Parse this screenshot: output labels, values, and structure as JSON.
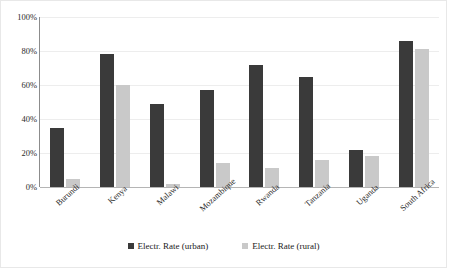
{
  "chart_data": {
    "type": "bar",
    "title": "",
    "xlabel": "",
    "ylabel": "",
    "ylim": [
      0,
      100
    ],
    "yunit": "%",
    "grid": true,
    "legend_position": "bottom",
    "categories": [
      "Burundi",
      "Kenya",
      "Malawi",
      "Mozambique",
      "Rwanda",
      "Tanzania",
      "Uganda",
      "South Africa"
    ],
    "ytick_labels": [
      "100%",
      "80%",
      "60%",
      "40%",
      "20%",
      "0%"
    ],
    "ytick_values": [
      100,
      80,
      60,
      40,
      20,
      0
    ],
    "series": [
      {
        "name": "Electr. Rate (urban)",
        "color": "#3a3a3a",
        "values": [
          35,
          78,
          49,
          57,
          72,
          65,
          22,
          86
        ]
      },
      {
        "name": "Electr. Rate (rural)",
        "color": "#c9c9c9",
        "values": [
          5,
          60,
          2,
          14,
          11,
          16,
          18,
          81
        ]
      }
    ]
  },
  "legend": {
    "items": [
      {
        "label": "Electr. Rate (urban)",
        "swatch": "urban"
      },
      {
        "label": "Electr. Rate (rural)",
        "swatch": "rural"
      }
    ]
  }
}
